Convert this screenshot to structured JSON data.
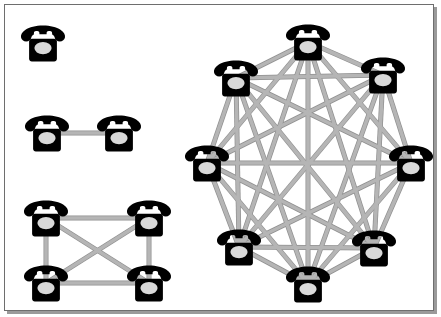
{
  "figure": {
    "background_color": "#ffffff",
    "panel_border_color": "#6e6e6e",
    "panel_shadow_color": "#9a9a9a",
    "edge_color": "#b5b5b5",
    "edge_outline_color": "#8f8f8f",
    "edge_width": 3.6,
    "node_icon": "telephone-icon",
    "node_body_color": "#000000",
    "node_dial_color": "#d9d9d9",
    "node_count_total": 15,
    "edge_count_total": 35
  },
  "groups": [
    {
      "id": "group-1",
      "name": "single-phone-group",
      "node_count": 1,
      "edge_count": 0,
      "nodes": [
        {
          "id": "n1-a",
          "label": "phone-1",
          "x": 38,
          "y": 38
        }
      ],
      "edges": []
    },
    {
      "id": "group-2",
      "name": "two-phone-group",
      "node_count": 2,
      "edge_count": 1,
      "nodes": [
        {
          "id": "n2-a",
          "label": "phone-1",
          "x": 42,
          "y": 128
        },
        {
          "id": "n2-b",
          "label": "phone-2",
          "x": 114,
          "y": 128
        }
      ],
      "edges": [
        {
          "from": "n2-a",
          "to": "n2-b"
        }
      ]
    },
    {
      "id": "group-4",
      "name": "four-phone-group",
      "node_count": 4,
      "edge_count": 6,
      "nodes": [
        {
          "id": "n4-a",
          "label": "phone-1",
          "x": 41,
          "y": 213
        },
        {
          "id": "n4-b",
          "label": "phone-2",
          "x": 144,
          "y": 213
        },
        {
          "id": "n4-c",
          "label": "phone-3",
          "x": 41,
          "y": 278
        },
        {
          "id": "n4-d",
          "label": "phone-4",
          "x": 144,
          "y": 278
        }
      ],
      "edges": [
        {
          "from": "n4-a",
          "to": "n4-b"
        },
        {
          "from": "n4-a",
          "to": "n4-c"
        },
        {
          "from": "n4-a",
          "to": "n4-d"
        },
        {
          "from": "n4-b",
          "to": "n4-c"
        },
        {
          "from": "n4-b",
          "to": "n4-d"
        },
        {
          "from": "n4-c",
          "to": "n4-d"
        }
      ]
    },
    {
      "id": "group-8",
      "name": "eight-phone-group",
      "node_count": 8,
      "edge_count": 28,
      "nodes": [
        {
          "id": "n8-1",
          "label": "phone-1",
          "x": 303,
          "y": 37
        },
        {
          "id": "n8-2",
          "label": "phone-2",
          "x": 378,
          "y": 70
        },
        {
          "id": "n8-3",
          "label": "phone-3",
          "x": 406,
          "y": 158
        },
        {
          "id": "n8-4",
          "label": "phone-4",
          "x": 369,
          "y": 243
        },
        {
          "id": "n8-5",
          "label": "phone-5",
          "x": 303,
          "y": 279
        },
        {
          "id": "n8-6",
          "label": "phone-6",
          "x": 234,
          "y": 242
        },
        {
          "id": "n8-7",
          "label": "phone-7",
          "x": 202,
          "y": 158
        },
        {
          "id": "n8-8",
          "label": "phone-8",
          "x": 231,
          "y": 73
        }
      ],
      "edges": [
        {
          "from": "n8-1",
          "to": "n8-2"
        },
        {
          "from": "n8-1",
          "to": "n8-3"
        },
        {
          "from": "n8-1",
          "to": "n8-4"
        },
        {
          "from": "n8-1",
          "to": "n8-5"
        },
        {
          "from": "n8-1",
          "to": "n8-6"
        },
        {
          "from": "n8-1",
          "to": "n8-7"
        },
        {
          "from": "n8-1",
          "to": "n8-8"
        },
        {
          "from": "n8-2",
          "to": "n8-3"
        },
        {
          "from": "n8-2",
          "to": "n8-4"
        },
        {
          "from": "n8-2",
          "to": "n8-5"
        },
        {
          "from": "n8-2",
          "to": "n8-6"
        },
        {
          "from": "n8-2",
          "to": "n8-7"
        },
        {
          "from": "n8-2",
          "to": "n8-8"
        },
        {
          "from": "n8-3",
          "to": "n8-4"
        },
        {
          "from": "n8-3",
          "to": "n8-5"
        },
        {
          "from": "n8-3",
          "to": "n8-6"
        },
        {
          "from": "n8-3",
          "to": "n8-7"
        },
        {
          "from": "n8-3",
          "to": "n8-8"
        },
        {
          "from": "n8-4",
          "to": "n8-5"
        },
        {
          "from": "n8-4",
          "to": "n8-6"
        },
        {
          "from": "n8-4",
          "to": "n8-7"
        },
        {
          "from": "n8-4",
          "to": "n8-8"
        },
        {
          "from": "n8-5",
          "to": "n8-6"
        },
        {
          "from": "n8-5",
          "to": "n8-7"
        },
        {
          "from": "n8-5",
          "to": "n8-8"
        },
        {
          "from": "n8-6",
          "to": "n8-7"
        },
        {
          "from": "n8-6",
          "to": "n8-8"
        },
        {
          "from": "n8-7",
          "to": "n8-8"
        }
      ]
    }
  ]
}
